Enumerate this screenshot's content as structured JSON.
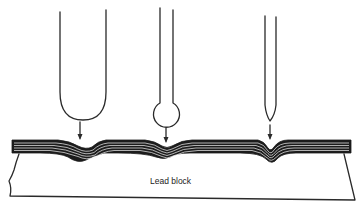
{
  "figure": {
    "label": "Lead block",
    "probes": [
      {
        "name": "large-round-indenter",
        "shape": "U-shaped blunt tip"
      },
      {
        "name": "ball-tip-indenter",
        "shape": "ball on narrow stem"
      },
      {
        "name": "sharp-tip-indenter",
        "shape": "narrow pointed tip"
      }
    ],
    "colors": {
      "ink": "#2a2a2a",
      "sheet": "#1c1c1c",
      "background": "#ffffff"
    }
  }
}
